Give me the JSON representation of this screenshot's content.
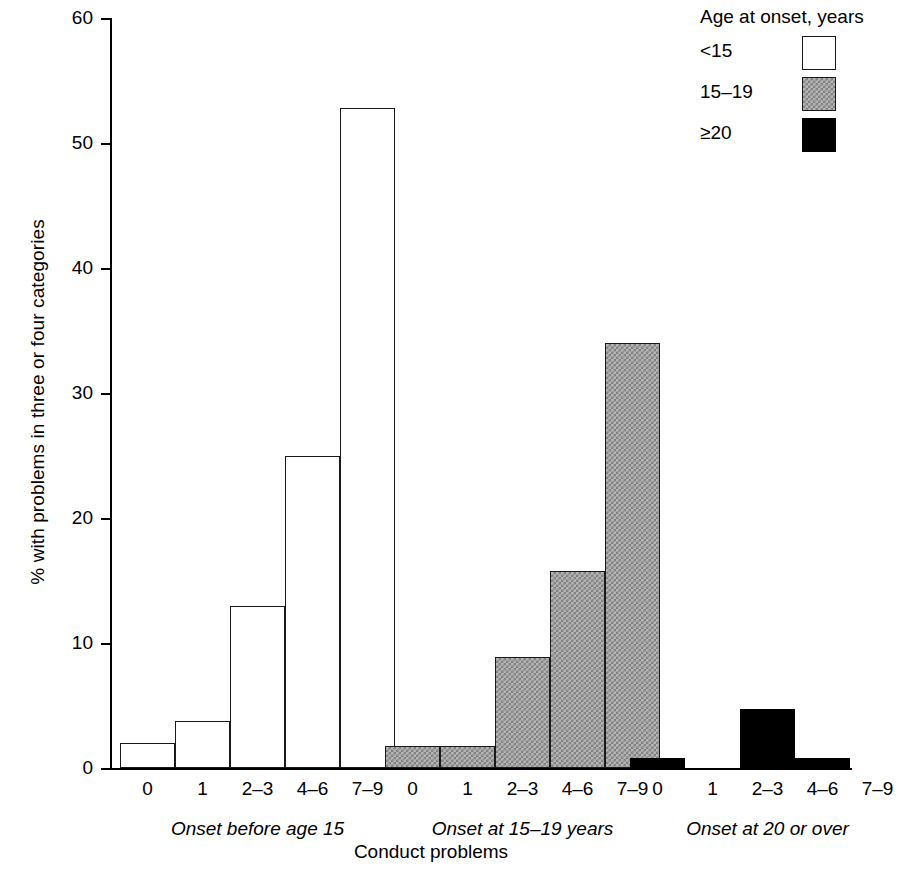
{
  "chart_data": {
    "type": "bar",
    "title": "",
    "xlabel": "Conduct problems",
    "ylabel": "% with problems in three or four categories",
    "ylim": [
      0,
      60
    ],
    "yticks": [
      0,
      10,
      20,
      30,
      40,
      50,
      60
    ],
    "ytick_labels": [
      "0",
      "10",
      "20",
      "30",
      "40",
      "50",
      "60"
    ],
    "grid": false,
    "legend_position": "top-right",
    "categories": [
      "0",
      "1",
      "2-3",
      "4-6",
      "7-9"
    ],
    "groups": [
      {
        "caption": "Onset before age 15",
        "series": "<15",
        "style": "open",
        "values": [
          2.0,
          3.8,
          13.0,
          25.0,
          52.8
        ]
      },
      {
        "caption": "Onset at 15-19 years",
        "series": "15-19",
        "style": "hatch",
        "values": [
          1.8,
          1.8,
          8.9,
          15.8,
          34.0
        ]
      },
      {
        "caption": "Onset at 20 or over",
        "series": "≥20",
        "style": "solid",
        "values": [
          0.8,
          0,
          4.7,
          0.8,
          0
        ]
      }
    ],
    "series": [
      {
        "name": "<15",
        "values": [
          2.0,
          3.8,
          13.0,
          25.0,
          52.8
        ]
      },
      {
        "name": "15-19",
        "values": [
          1.8,
          1.8,
          8.9,
          15.8,
          34.0
        ]
      },
      {
        "name": "≥20",
        "values": [
          0.8,
          0,
          4.7,
          0.8,
          0
        ]
      }
    ]
  },
  "legend": {
    "title": "Age at onset, years",
    "entries": [
      {
        "label": "<15",
        "swatch": "white-square-icon"
      },
      {
        "label": "15–19",
        "swatch": "hatched-square-icon"
      },
      {
        "label": "≥20",
        "swatch": "black-square-icon"
      }
    ]
  },
  "axes": {
    "x_title": "Conduct problems",
    "y_title": "% with problems in three or four categories",
    "y_ticks": [
      "0",
      "10",
      "20",
      "30",
      "40",
      "50",
      "60"
    ],
    "x_tick_labels": [
      "0",
      "1",
      "2–3",
      "4–6",
      "7–9"
    ],
    "group_captions": [
      "Onset before age 15",
      "Onset at 15–19 years",
      "Onset at 20 or over"
    ]
  },
  "colors": {
    "axis": "#000000",
    "bar_open_fill": "#ffffff",
    "bar_open_stroke": "#1a1a1a",
    "bar_hatch_fill": "#b4b4b4",
    "bar_solid_fill": "#000000",
    "background": "#ffffff"
  }
}
